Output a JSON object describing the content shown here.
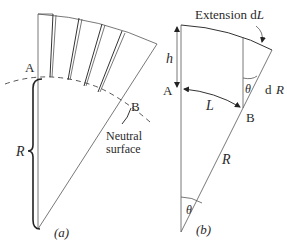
{
  "figure": {
    "panel_a": {
      "caption": "(a)",
      "label_A": "A",
      "label_B": "B",
      "label_R": "R",
      "neutral_surface_line1": "Neutral",
      "neutral_surface_line2": "surface"
    },
    "panel_b": {
      "caption": "(b)",
      "label_A": "A",
      "label_B": "B",
      "label_h": "h",
      "label_L": "L",
      "label_R": "R",
      "label_theta_top": "θ",
      "label_theta_apex": "θ",
      "label_dR_d": "d",
      "label_dR_R": "R",
      "extension_text": "Extension d",
      "extension_var": "L"
    }
  }
}
